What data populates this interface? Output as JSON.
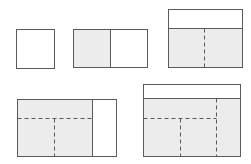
{
  "diagram": {
    "title": "",
    "colors": {
      "stroke": "#5a5a5a",
      "shaded_fill": "#ececec",
      "plain_fill": "#ffffff",
      "background": "#ffffff"
    },
    "stages": [
      {
        "id": 1,
        "label": "",
        "description": "single unshaded square"
      },
      {
        "id": 2,
        "label": "",
        "description": "shaded square plus unshaded square side by side"
      },
      {
        "id": 3,
        "label": "",
        "description": "unshaded header strip over two shaded squares split by dashed line"
      },
      {
        "id": 4,
        "label": "",
        "description": "shaded block subdivided by dashed lines plus unshaded strip on the right"
      },
      {
        "id": 5,
        "label": "",
        "description": "unshaded header strip over shaded block subdivided by dashed lines"
      }
    ]
  }
}
